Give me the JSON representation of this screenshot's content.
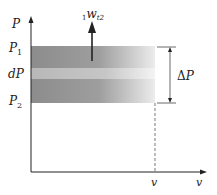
{
  "diagram": {
    "type": "P-v diagram",
    "axes": {
      "y_label": "P",
      "x_label": "v"
    },
    "labels": {
      "p1": "P",
      "p1_sub": "1",
      "p2": "P",
      "p2_sub": "2",
      "dp": "dP",
      "delta_p_symbol": "Δ",
      "delta_p_var": "P",
      "v_mark": "v",
      "work_pre_sub": "1",
      "work_main": "w",
      "work_post_sub": "t2"
    },
    "colors": {
      "band_dark_left": "#8a8a8a",
      "band_dark_right": "#e8e8e8",
      "band_light_left": "#b4b4b4",
      "band_light_right": "#f2f2f2",
      "line": "#222222",
      "dim_line": "#444444"
    }
  }
}
